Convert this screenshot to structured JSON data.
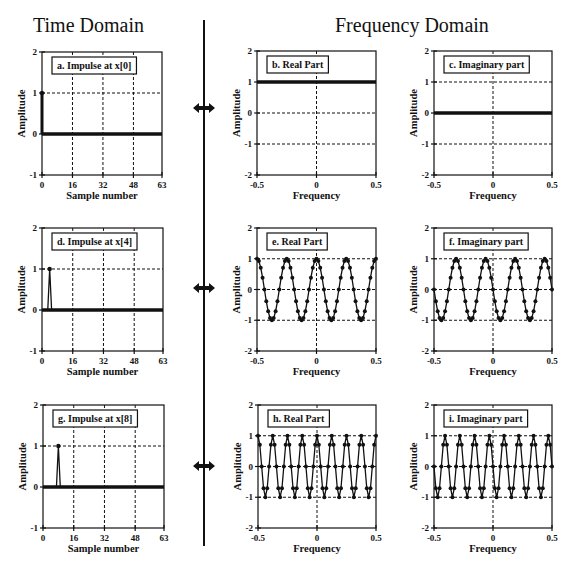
{
  "headers": {
    "time_domain": "Time Domain",
    "frequency_domain": "Frequency Domain"
  },
  "colors": {
    "ink": "#111111",
    "background": "#ffffff",
    "grid": "#111111"
  },
  "chart_data": [
    {
      "id": "a",
      "type": "line",
      "title": "a. Impulse at x[0]",
      "xlabel": "Sample number",
      "ylabel": "Amplitude",
      "xlim": [
        0,
        63
      ],
      "ylim": [
        -1,
        2
      ],
      "xticks": [
        0,
        16,
        32,
        48,
        63
      ],
      "yticks": [
        -1,
        0,
        1,
        2
      ],
      "impulse_at": 0,
      "n_samples": 64,
      "frame": {
        "x": 42,
        "y": 52,
        "w": 120,
        "h": 123
      }
    },
    {
      "id": "b",
      "type": "line",
      "title": "b. Real Part",
      "xlabel": "Frequency",
      "ylabel": "Amplitude",
      "xlim": [
        -0.5,
        0.5
      ],
      "ylim": [
        -2,
        2
      ],
      "xticks": [
        -0.5,
        0,
        0.5
      ],
      "yticks": [
        -2,
        -1,
        0,
        1,
        2
      ],
      "function": "cos",
      "k": 0,
      "constant": 1,
      "frame": {
        "x": 257,
        "y": 51,
        "w": 119,
        "h": 124
      }
    },
    {
      "id": "c",
      "type": "line",
      "title": "c. Imaginary part",
      "xlabel": "Frequency",
      "ylabel": "Amplitude",
      "xlim": [
        -0.5,
        0.5
      ],
      "ylim": [
        -2,
        2
      ],
      "xticks": [
        -0.5,
        0,
        0.5
      ],
      "yticks": [
        -2,
        -1,
        0,
        1,
        2
      ],
      "function": "negsin",
      "k": 0,
      "constant": 0,
      "frame": {
        "x": 434,
        "y": 51,
        "w": 118,
        "h": 124
      }
    },
    {
      "id": "d",
      "type": "line",
      "title": "d. Impulse at x[4]",
      "xlabel": "Sample number",
      "ylabel": "Amplitude",
      "xlim": [
        0,
        63
      ],
      "ylim": [
        -1,
        2
      ],
      "xticks": [
        0,
        16,
        32,
        48,
        63
      ],
      "yticks": [
        -1,
        0,
        1,
        2
      ],
      "impulse_at": 4,
      "n_samples": 64,
      "frame": {
        "x": 42,
        "y": 228,
        "w": 121,
        "h": 123
      }
    },
    {
      "id": "e",
      "type": "line",
      "title": "e. Real Part",
      "xlabel": "Frequency",
      "ylabel": "Amplitude",
      "xlim": [
        -0.5,
        0.5
      ],
      "ylim": [
        -2,
        2
      ],
      "xticks": [
        -0.5,
        0,
        0.5
      ],
      "yticks": [
        -2,
        -1,
        0,
        1,
        2
      ],
      "function": "cos",
      "k": 4,
      "n_points": 65,
      "frame": {
        "x": 257,
        "y": 228,
        "w": 119,
        "h": 123
      }
    },
    {
      "id": "f",
      "type": "line",
      "title": "f. Imaginary part",
      "xlabel": "Frequency",
      "ylabel": "Amplitude",
      "xlim": [
        -0.5,
        0.5
      ],
      "ylim": [
        -2,
        2
      ],
      "xticks": [
        -0.5,
        0,
        0.5
      ],
      "yticks": [
        -2,
        -1,
        0,
        1,
        2
      ],
      "function": "negsin",
      "k": 4,
      "n_points": 65,
      "frame": {
        "x": 434,
        "y": 228,
        "w": 118,
        "h": 123
      }
    },
    {
      "id": "g",
      "type": "line",
      "title": "g. Impulse at x[8]",
      "xlabel": "Sample number",
      "ylabel": "Amplitude",
      "xlim": [
        0,
        63
      ],
      "ylim": [
        -1,
        2
      ],
      "xticks": [
        0,
        16,
        32,
        48,
        63
      ],
      "yticks": [
        -1,
        0,
        1,
        2
      ],
      "impulse_at": 8,
      "n_samples": 64,
      "frame": {
        "x": 43,
        "y": 405,
        "w": 121,
        "h": 123
      }
    },
    {
      "id": "h",
      "type": "line",
      "title": "h. Real Part",
      "xlabel": "Frequency",
      "ylabel": "Amplitude",
      "xlim": [
        -0.5,
        0.5
      ],
      "ylim": [
        -2,
        2
      ],
      "xticks": [
        -0.5,
        0,
        0.5
      ],
      "yticks": [
        -2,
        -1,
        0,
        1,
        2
      ],
      "function": "cos",
      "k": 8,
      "n_points": 65,
      "frame": {
        "x": 258,
        "y": 405,
        "w": 118,
        "h": 123
      }
    },
    {
      "id": "i",
      "type": "line",
      "title": "i. Imaginary part",
      "xlabel": "Frequency",
      "ylabel": "Amplitude",
      "xlim": [
        -0.5,
        0.5
      ],
      "ylim": [
        -2,
        2
      ],
      "xticks": [
        -0.5,
        0,
        0.5
      ],
      "yticks": [
        -2,
        -1,
        0,
        1,
        2
      ],
      "function": "negsin",
      "k": 8,
      "n_points": 65,
      "frame": {
        "x": 434,
        "y": 405,
        "w": 118,
        "h": 123
      }
    }
  ],
  "arrows": [
    {
      "id": "row1",
      "y": 108
    },
    {
      "id": "row2",
      "y": 288
    },
    {
      "id": "row3",
      "y": 466
    }
  ]
}
